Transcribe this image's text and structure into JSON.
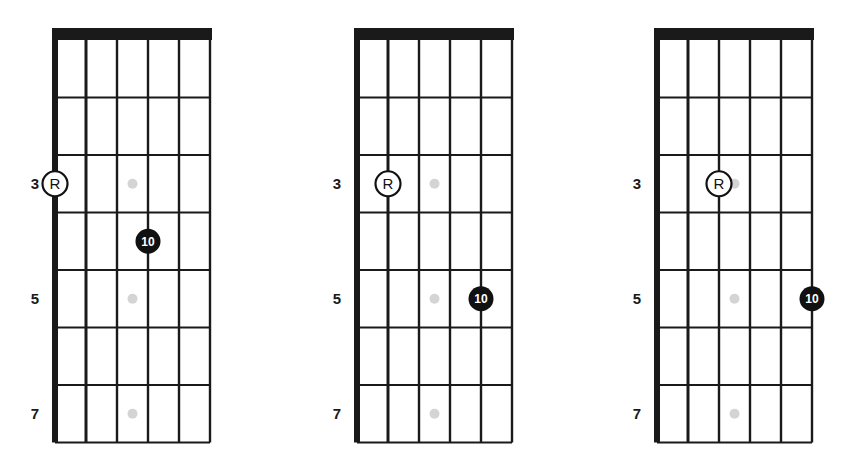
{
  "figure": {
    "name": "guitar-fretboard-diagrams",
    "background_color": "#ffffff",
    "line_color": "#1a1a1a",
    "nut_color": "#1a1a1a",
    "inlay_color": "#d4d4d4",
    "marker_fill_color": "#111111",
    "marker_text_color": "#ffffff",
    "root_marker_stroke_color": "#111111"
  },
  "chart_data": {
    "type": "diagram",
    "title": "",
    "subtitle": "",
    "xlabel": "",
    "ylabel": "",
    "legend": [],
    "grid": true,
    "string_count": 6,
    "fret_count": 7,
    "string_order": "left-to-right: string 6 (low E) to string 1 (high E)",
    "fret_number_labels": [
      "3",
      "5",
      "7"
    ],
    "fret_number_positions": [
      3,
      5,
      7
    ],
    "inlay_dots": [
      {
        "fret": 3,
        "between_strings": [
          3,
          4
        ]
      },
      {
        "fret": 5,
        "between_strings": [
          3,
          4
        ]
      },
      {
        "fret": 7,
        "between_strings": [
          3,
          4
        ]
      }
    ],
    "diagrams": [
      {
        "id": "diagram-1",
        "label": "",
        "markers": [
          {
            "type": "root",
            "label": "R",
            "string": 6,
            "fret": 3,
            "style": "open-circle"
          },
          {
            "type": "interval",
            "label": "10",
            "string": 3,
            "fret": 4,
            "style": "filled-circle"
          }
        ]
      },
      {
        "id": "diagram-2",
        "label": "",
        "markers": [
          {
            "type": "root",
            "label": "R",
            "string": 5,
            "fret": 3,
            "style": "open-circle"
          },
          {
            "type": "interval",
            "label": "10",
            "string": 2,
            "fret": 5,
            "style": "filled-circle"
          }
        ]
      },
      {
        "id": "diagram-3",
        "label": "",
        "markers": [
          {
            "type": "root",
            "label": "R",
            "string": 4,
            "fret": 3,
            "style": "open-circle"
          },
          {
            "type": "interval",
            "label": "10",
            "string": 1,
            "fret": 5,
            "style": "filled-circle"
          }
        ]
      }
    ]
  },
  "diagram_1": {
    "fret_numbers": [
      "3",
      "5",
      "7"
    ],
    "root_label": "R",
    "interval_label": "10"
  },
  "diagram_2": {
    "fret_numbers": [
      "3",
      "5",
      "7"
    ],
    "root_label": "R",
    "interval_label": "10"
  },
  "diagram_3": {
    "fret_numbers": [
      "3",
      "5",
      "7"
    ],
    "root_label": "R",
    "interval_label": "10"
  }
}
